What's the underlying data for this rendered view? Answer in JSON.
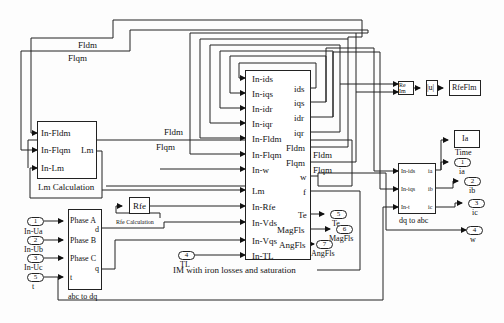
{
  "diagram": {
    "main_block": {
      "label": "IM with iron losses and saturation",
      "inputs": [
        "In-ids",
        "In-iqs",
        "In-idr",
        "In-iqr",
        "In-Fldm",
        "In-Flqm",
        "In-w",
        "Lm",
        "In-Rfe",
        "In-Vds",
        "In-Vqs",
        "In-TL"
      ],
      "outputs": [
        "ids",
        "iqs",
        "idr",
        "iqr",
        "Fldm",
        "Flqm",
        "w",
        "f",
        "Te",
        "MagFls",
        "AngFls"
      ]
    },
    "lm_block": {
      "label": "Lm Calculation",
      "inputs": [
        "In-Fldm",
        "In-Flqm",
        "In-Lm"
      ],
      "output": "Lm"
    },
    "rfe_block": {
      "text": "Rfe",
      "label": "Rfe Calculation"
    },
    "abc_dq_block": {
      "label": "abc to dq",
      "inputs": [
        "Phase A",
        "Phase B",
        "Phase C",
        "t"
      ],
      "outputs": [
        "d",
        "q"
      ]
    },
    "dq_abc_block": {
      "label": "dq to abc",
      "inputs": [
        "In-ids",
        "In-iqs",
        "In-t"
      ],
      "outputs": [
        "ia",
        "ib",
        "ic"
      ]
    },
    "complex_block": {
      "inputs": [
        "Re",
        "Im"
      ]
    },
    "abs_block": {
      "text": "|u|"
    },
    "goto_block": {
      "text": "RfeFlm"
    },
    "scope_block": {
      "text": "Ia",
      "label": "Time"
    },
    "inports": [
      {
        "num": "1",
        "name": "In-Ua"
      },
      {
        "num": "2",
        "name": "In-Ub"
      },
      {
        "num": "3",
        "name": "In-Uc"
      },
      {
        "num": "5",
        "name": "t"
      },
      {
        "num": "4",
        "name": "TL"
      }
    ],
    "outports": [
      {
        "num": "1",
        "name": "ia"
      },
      {
        "num": "2",
        "name": "ib"
      },
      {
        "num": "3",
        "name": "ic"
      },
      {
        "num": "4",
        "name": "w"
      },
      {
        "num": "5",
        "name": "Te"
      },
      {
        "num": "6",
        "name": "MagFls"
      },
      {
        "num": "7",
        "name": "AngFls"
      }
    ],
    "signal_labels": {
      "fldm_top": "Fldm",
      "flqm_top": "Flqm",
      "fldm_mid": "Fldm",
      "flqm_mid": "Flqm",
      "fldm_out": "Fldm",
      "flqm_out": "Flqm"
    }
  }
}
